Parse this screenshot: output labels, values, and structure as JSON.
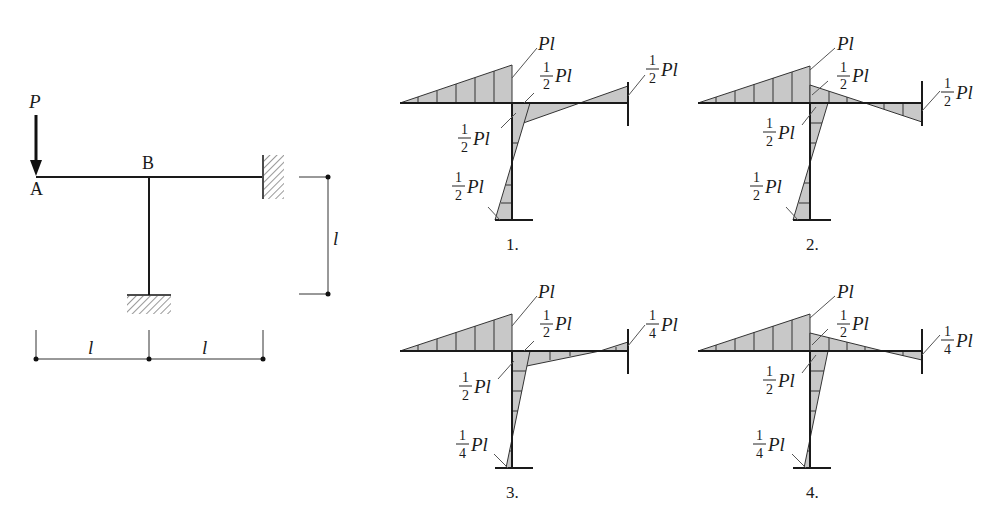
{
  "problem": {
    "load_label": "P",
    "node_a": "A",
    "node_b": "B",
    "dim_left": "l",
    "dim_right": "l",
    "dim_vertical": "l"
  },
  "options": [
    {
      "number": "1.",
      "labels": {
        "peak_b": "Pl",
        "beam_right_at_b": {
          "num": "1",
          "den": "2",
          "suffix": "Pl"
        },
        "col_top": {
          "num": "1",
          "den": "2",
          "suffix": "Pl"
        },
        "col_bottom": {
          "num": "1",
          "den": "2",
          "suffix": "Pl"
        },
        "right_end": {
          "num": "1",
          "den": "2",
          "suffix": "Pl"
        }
      }
    },
    {
      "number": "2.",
      "labels": {
        "peak_b": "Pl",
        "beam_right_at_b": {
          "num": "1",
          "den": "2",
          "suffix": "Pl"
        },
        "col_top": {
          "num": "1",
          "den": "2",
          "suffix": "Pl"
        },
        "col_bottom": {
          "num": "1",
          "den": "2",
          "suffix": "Pl"
        },
        "right_end": {
          "num": "1",
          "den": "2",
          "suffix": "Pl"
        }
      }
    },
    {
      "number": "3.",
      "labels": {
        "peak_b": "Pl",
        "beam_right_at_b": {
          "num": "1",
          "den": "2",
          "suffix": "Pl"
        },
        "col_top": {
          "num": "1",
          "den": "2",
          "suffix": "Pl"
        },
        "col_bottom": {
          "num": "1",
          "den": "4",
          "suffix": "Pl"
        },
        "right_end": {
          "num": "1",
          "den": "4",
          "suffix": "Pl"
        }
      }
    },
    {
      "number": "4.",
      "labels": {
        "peak_b": "Pl",
        "beam_right_at_b": {
          "num": "1",
          "den": "2",
          "suffix": "Pl"
        },
        "col_top": {
          "num": "1",
          "den": "2",
          "suffix": "Pl"
        },
        "col_bottom": {
          "num": "1",
          "den": "4",
          "suffix": "Pl"
        },
        "right_end": {
          "num": "1",
          "den": "4",
          "suffix": "Pl"
        }
      }
    }
  ]
}
